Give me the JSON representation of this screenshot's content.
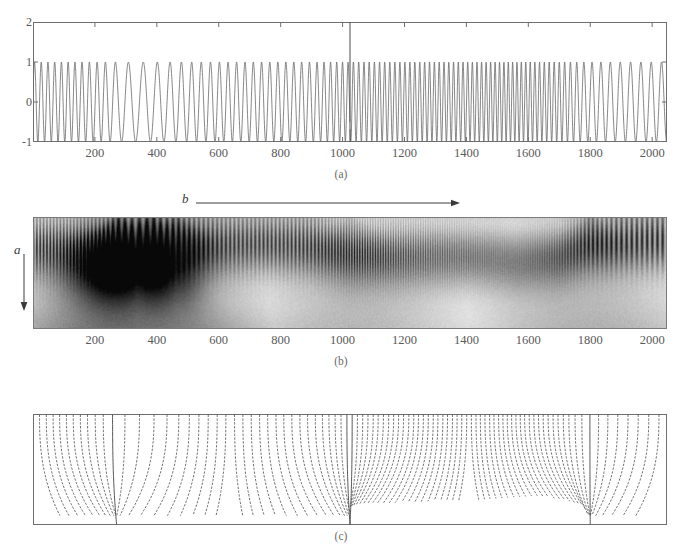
{
  "figure": {
    "panels": [
      {
        "id": "a",
        "caption": "(a)",
        "name": "signal-plot"
      },
      {
        "id": "b",
        "caption": "(b)",
        "name": "scalogram-plot",
        "axis_letters": {
          "scale": "a",
          "translation": "b"
        }
      },
      {
        "id": "c",
        "caption": "(c)",
        "name": "modulus-maxima-plot"
      }
    ]
  },
  "chart_data": [
    {
      "type": "line",
      "panel": "a",
      "title": "",
      "xlabel": "",
      "ylabel": "",
      "xlim": [
        0,
        2048
      ],
      "ylim": [
        -1,
        2
      ],
      "grid": false,
      "legend": null,
      "xticks": [
        200,
        400,
        600,
        800,
        1000,
        1200,
        1400,
        1600,
        1800,
        2000
      ],
      "xticklabels": [
        "200",
        "400",
        "600",
        "800",
        "1000",
        "1200",
        "1400",
        "1600",
        "1800",
        "2000"
      ],
      "yticks": [
        -1,
        0,
        1,
        2
      ],
      "yticklabels": [
        "-1",
        "0",
        "1",
        "2"
      ],
      "annotations": [
        {
          "kind": "vertical-discontinuity",
          "x": 1024,
          "label": ""
        }
      ],
      "description": "Oscillating signal with time-varying frequency, amplitude 1, plus a jump discontinuity at x=1024",
      "frequency_profile": {
        "x": [
          0,
          120,
          220,
          280,
          340,
          420,
          520,
          620,
          760,
          900,
          1024,
          1200,
          1400,
          1560,
          1700,
          1800,
          1900,
          2048
        ],
        "cycles_per_1000": [
          46,
          46,
          38,
          24,
          20,
          24,
          32,
          36,
          38,
          40,
          58,
          62,
          66,
          72,
          60,
          36,
          30,
          30
        ]
      }
    },
    {
      "type": "heatmap",
      "panel": "b",
      "title": "",
      "xlabel": "",
      "ylabel": "",
      "xlim": [
        0,
        2048
      ],
      "ylim": [
        0,
        1
      ],
      "grid": false,
      "xticks": [
        200,
        400,
        600,
        800,
        1000,
        1200,
        1400,
        1600,
        1800,
        2000
      ],
      "xticklabels": [
        "200",
        "400",
        "600",
        "800",
        "1000",
        "1200",
        "1400",
        "1600",
        "1800",
        "2000"
      ],
      "colormap": "gray-inverted",
      "axis_arrows": [
        {
          "letter": "a",
          "direction": "down",
          "meaning": "scale"
        },
        {
          "letter": "b",
          "direction": "right",
          "meaning": "translation"
        }
      ],
      "description": "Continuous wavelet transform modulus (scalogram); vertical ridges at oscillation periods, cone-shaped cusps at singularities near x=1024 and x=1800, darkest energy near x=270-460",
      "hotspots": [
        {
          "x": 270,
          "intensity": 1.0
        },
        {
          "x": 380,
          "intensity": 0.95
        },
        {
          "x": 460,
          "intensity": 0.7
        },
        {
          "x": 1024,
          "intensity": 0.55
        },
        {
          "x": 1800,
          "intensity": 0.6
        }
      ]
    },
    {
      "type": "line",
      "panel": "c",
      "title": "",
      "xlabel": "",
      "ylabel": "",
      "xlim": [
        0,
        2048
      ],
      "ylim": [
        0,
        1
      ],
      "grid": false,
      "description": "Wavelet transform modulus maxima lines descending from fine scales at the top; most terminate at mid scale, while lines converging at x=270 and x=1800 propagate to the coarsest scales",
      "maxima_lines_reaching_bottom": [
        270,
        1024,
        1800
      ]
    }
  ]
}
